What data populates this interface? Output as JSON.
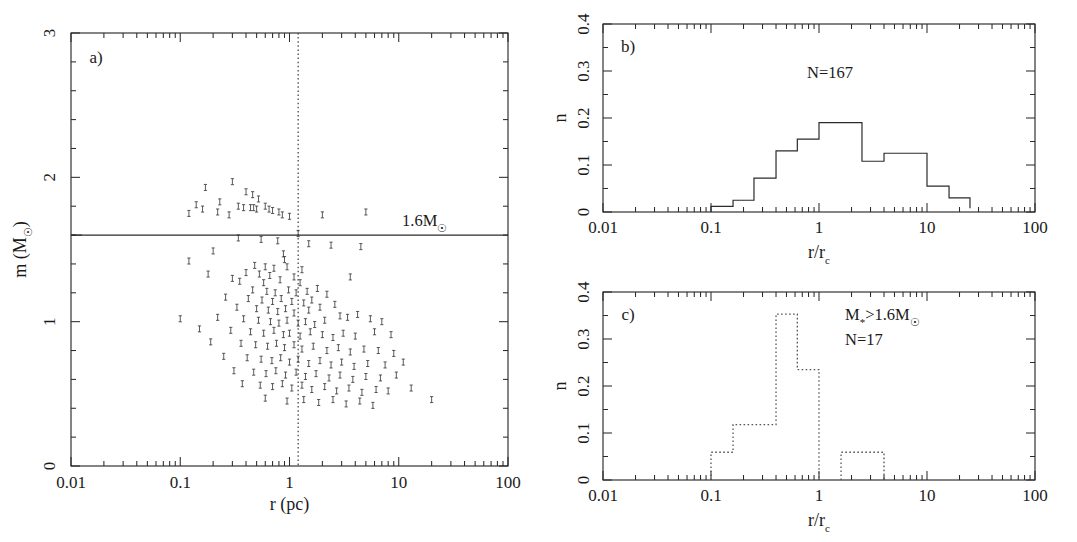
{
  "figure": {
    "background": "#ffffff",
    "ink": "#2b2b2b"
  },
  "panel_a": {
    "label": "a)",
    "xlabel": "r (pc)",
    "ylabel_main": "m (M",
    "ylabel_sub": "☉",
    "ylabel_close": ")",
    "xticklabels": [
      "0.01",
      "0.1",
      "1",
      "10",
      "100"
    ],
    "yticklabels": [
      "0",
      "1",
      "2",
      "3"
    ],
    "cut_label_main": "1.6M",
    "cut_label_sub": "☉",
    "cut_value": 1.6,
    "vline_value": 1.2
  },
  "panel_b": {
    "label": "b)",
    "xlabel_num": "r/r",
    "xlabel_sub": "c",
    "ylabel": "n",
    "annotation": "N=167",
    "xticklabels": [
      "0.01",
      "0.1",
      "1",
      "10",
      "100"
    ],
    "yticklabels": [
      "0",
      "0.1",
      "0.2",
      "0.3",
      "0.4"
    ]
  },
  "panel_c": {
    "label": "c)",
    "xlabel_num": "r/r",
    "xlabel_sub": "c",
    "ylabel": "n",
    "annotation_mass_pre": "M",
    "annotation_mass_star": "*",
    "annotation_mass_mid": ">1.6M",
    "annotation_mass_sun": "☉",
    "annotation_n": "N=17",
    "xticklabels": [
      "0.01",
      "0.1",
      "1",
      "10",
      "100"
    ],
    "yticklabels": [
      "0",
      "0.1",
      "0.2",
      "0.3",
      "0.4"
    ]
  },
  "chart_data": [
    {
      "type": "scatter",
      "panel": "a",
      "title": "",
      "xlabel": "r (pc)",
      "ylabel": "m (M☉)",
      "xscale": "log",
      "yscale": "linear",
      "xlim": [
        0.01,
        100
      ],
      "ylim": [
        0,
        3
      ],
      "xticks": [
        0.01,
        0.1,
        1,
        10,
        100
      ],
      "yticks": [
        0,
        1,
        2,
        3
      ],
      "grid": false,
      "annotations": [
        {
          "text": "a)",
          "x": 0.018,
          "y": 2.78
        },
        {
          "text": "1.6M☉",
          "x": 3.0,
          "y": 1.71
        }
      ],
      "reference_lines": [
        {
          "orientation": "horizontal",
          "value": 1.6,
          "style": "solid",
          "label": "1.6M☉"
        },
        {
          "orientation": "vertical",
          "value": 1.2,
          "style": "dotted",
          "label": ""
        }
      ],
      "marker": "small-errorbar-point",
      "points": [
        [
          0.17,
          1.93
        ],
        [
          0.3,
          1.97
        ],
        [
          0.4,
          1.9
        ],
        [
          0.46,
          1.88
        ],
        [
          0.52,
          1.85
        ],
        [
          0.23,
          1.83
        ],
        [
          0.34,
          1.8
        ],
        [
          0.6,
          1.8
        ],
        [
          0.65,
          1.78
        ],
        [
          0.8,
          1.76
        ],
        [
          0.14,
          1.81
        ],
        [
          0.16,
          1.78
        ],
        [
          0.22,
          1.76
        ],
        [
          0.38,
          1.79
        ],
        [
          0.44,
          1.79
        ],
        [
          0.47,
          1.79
        ],
        [
          0.5,
          1.78
        ],
        [
          0.7,
          1.77
        ],
        [
          0.86,
          1.74
        ],
        [
          1.0,
          1.73
        ],
        [
          0.12,
          1.75
        ],
        [
          0.28,
          1.74
        ],
        [
          2.0,
          1.74
        ],
        [
          5.0,
          1.76
        ],
        [
          1.2,
          1.61
        ],
        [
          0.34,
          1.58
        ],
        [
          0.55,
          1.57
        ],
        [
          0.78,
          1.56
        ],
        [
          1.5,
          1.54
        ],
        [
          2.4,
          1.53
        ],
        [
          4.5,
          1.52
        ],
        [
          0.2,
          1.49
        ],
        [
          0.88,
          1.47
        ],
        [
          0.9,
          1.43
        ],
        [
          0.12,
          1.42
        ],
        [
          0.48,
          1.39
        ],
        [
          0.6,
          1.38
        ],
        [
          0.72,
          1.37
        ],
        [
          0.95,
          1.38
        ],
        [
          1.3,
          1.36
        ],
        [
          0.18,
          1.33
        ],
        [
          0.4,
          1.34
        ],
        [
          0.53,
          1.33
        ],
        [
          0.66,
          1.32
        ],
        [
          1.1,
          1.31
        ],
        [
          0.3,
          1.3
        ],
        [
          0.35,
          1.28
        ],
        [
          0.58,
          1.27
        ],
        [
          0.82,
          1.29
        ],
        [
          1.25,
          1.27
        ],
        [
          3.6,
          1.31
        ],
        [
          0.46,
          1.22
        ],
        [
          0.62,
          1.21
        ],
        [
          0.74,
          1.2
        ],
        [
          0.98,
          1.22
        ],
        [
          1.15,
          1.2
        ],
        [
          1.45,
          1.21
        ],
        [
          1.8,
          1.23
        ],
        [
          2.2,
          1.19
        ],
        [
          0.26,
          1.17
        ],
        [
          0.42,
          1.16
        ],
        [
          0.56,
          1.15
        ],
        [
          0.7,
          1.14
        ],
        [
          0.84,
          1.16
        ],
        [
          1.05,
          1.14
        ],
        [
          1.35,
          1.13
        ],
        [
          1.6,
          1.15
        ],
        [
          0.33,
          1.1
        ],
        [
          0.5,
          1.09
        ],
        [
          0.64,
          1.08
        ],
        [
          0.78,
          1.07
        ],
        [
          0.92,
          1.09
        ],
        [
          1.1,
          1.06
        ],
        [
          1.5,
          1.08
        ],
        [
          1.9,
          1.1
        ],
        [
          2.6,
          1.12
        ],
        [
          0.1,
          1.02
        ],
        [
          0.22,
          1.03
        ],
        [
          0.38,
          1.02
        ],
        [
          0.52,
          1.01
        ],
        [
          0.67,
          1.0
        ],
        [
          0.8,
          0.99
        ],
        [
          0.95,
          1.01
        ],
        [
          1.2,
          0.99
        ],
        [
          1.4,
          1.0
        ],
        [
          1.7,
          0.98
        ],
        [
          2.1,
          1.01
        ],
        [
          2.9,
          1.04
        ],
        [
          3.4,
          1.03
        ],
        [
          4.2,
          1.05
        ],
        [
          5.5,
          1.02
        ],
        [
          7.0,
          1.0
        ],
        [
          0.15,
          0.95
        ],
        [
          0.29,
          0.94
        ],
        [
          0.44,
          0.93
        ],
        [
          0.58,
          0.92
        ],
        [
          0.72,
          0.94
        ],
        [
          0.88,
          0.91
        ],
        [
          1.0,
          0.92
        ],
        [
          1.25,
          0.9
        ],
        [
          1.55,
          0.93
        ],
        [
          2.0,
          0.91
        ],
        [
          2.5,
          0.89
        ],
        [
          3.1,
          0.92
        ],
        [
          4.0,
          0.9
        ],
        [
          6.0,
          0.93
        ],
        [
          8.5,
          0.91
        ],
        [
          0.19,
          0.86
        ],
        [
          0.36,
          0.85
        ],
        [
          0.49,
          0.84
        ],
        [
          0.63,
          0.83
        ],
        [
          0.76,
          0.85
        ],
        [
          0.9,
          0.82
        ],
        [
          1.1,
          0.84
        ],
        [
          1.3,
          0.81
        ],
        [
          1.65,
          0.83
        ],
        [
          2.2,
          0.8
        ],
        [
          2.8,
          0.82
        ],
        [
          3.6,
          0.79
        ],
        [
          4.8,
          0.81
        ],
        [
          6.5,
          0.8
        ],
        [
          9.0,
          0.78
        ],
        [
          0.25,
          0.76
        ],
        [
          0.41,
          0.75
        ],
        [
          0.55,
          0.74
        ],
        [
          0.69,
          0.73
        ],
        [
          0.83,
          0.75
        ],
        [
          1.0,
          0.72
        ],
        [
          1.2,
          0.74
        ],
        [
          1.5,
          0.71
        ],
        [
          1.9,
          0.73
        ],
        [
          2.4,
          0.7
        ],
        [
          3.0,
          0.72
        ],
        [
          3.9,
          0.69
        ],
        [
          5.2,
          0.71
        ],
        [
          7.5,
          0.7
        ],
        [
          11.0,
          0.72
        ],
        [
          0.31,
          0.66
        ],
        [
          0.47,
          0.65
        ],
        [
          0.61,
          0.64
        ],
        [
          0.75,
          0.66
        ],
        [
          0.92,
          0.63
        ],
        [
          1.15,
          0.65
        ],
        [
          1.4,
          0.62
        ],
        [
          1.75,
          0.64
        ],
        [
          2.3,
          0.61
        ],
        [
          2.9,
          0.63
        ],
        [
          3.8,
          0.6
        ],
        [
          5.0,
          0.62
        ],
        [
          6.8,
          0.61
        ],
        [
          9.5,
          0.63
        ],
        [
          0.37,
          0.57
        ],
        [
          0.54,
          0.56
        ],
        [
          0.7,
          0.55
        ],
        [
          0.86,
          0.57
        ],
        [
          1.05,
          0.54
        ],
        [
          1.3,
          0.56
        ],
        [
          1.6,
          0.53
        ],
        [
          2.1,
          0.55
        ],
        [
          2.7,
          0.52
        ],
        [
          3.5,
          0.54
        ],
        [
          4.6,
          0.51
        ],
        [
          6.2,
          0.53
        ],
        [
          8.0,
          0.52
        ],
        [
          13.0,
          0.54
        ],
        [
          0.6,
          0.47
        ],
        [
          0.95,
          0.45
        ],
        [
          1.35,
          0.46
        ],
        [
          1.85,
          0.44
        ],
        [
          2.5,
          0.46
        ],
        [
          3.3,
          0.43
        ],
        [
          4.4,
          0.45
        ],
        [
          5.8,
          0.42
        ],
        [
          20.0,
          0.46
        ]
      ]
    },
    {
      "type": "bar",
      "panel": "b",
      "subtype": "histogram-step",
      "title": "",
      "xlabel": "r/r_c",
      "ylabel": "n",
      "xscale": "log",
      "yscale": "linear",
      "xlim": [
        0.01,
        100
      ],
      "ylim": [
        0,
        0.4
      ],
      "xticks": [
        0.01,
        0.1,
        1,
        10,
        100
      ],
      "yticks": [
        0,
        0.1,
        0.2,
        0.3,
        0.4
      ],
      "grid": false,
      "line_style": "solid",
      "annotations": [
        {
          "text": "b)",
          "x": 0.018,
          "y": 0.365
        },
        {
          "text": "N=167",
          "x": 1.0,
          "y": 0.3
        }
      ],
      "bin_edges": [
        0.1,
        0.16,
        0.25,
        0.4,
        0.63,
        1.0,
        1.6,
        2.5,
        4.0,
        6.3,
        10.0,
        16.0,
        25.0
      ],
      "values": [
        0.012,
        0.025,
        0.072,
        0.13,
        0.155,
        0.19,
        0.19,
        0.108,
        0.125,
        0.125,
        0.055,
        0.03,
        0.008
      ],
      "total_count": 167
    },
    {
      "type": "bar",
      "panel": "c",
      "subtype": "histogram-step",
      "title": "",
      "xlabel": "r/r_c",
      "ylabel": "n",
      "xscale": "log",
      "yscale": "linear",
      "xlim": [
        0.01,
        100
      ],
      "ylim": [
        0,
        0.4
      ],
      "xticks": [
        0.01,
        0.1,
        1,
        10,
        100
      ],
      "yticks": [
        0,
        0.1,
        0.2,
        0.3,
        0.4
      ],
      "grid": false,
      "line_style": "dotted",
      "annotations": [
        {
          "text": "M*>1.6M☉",
          "x": 1.6,
          "y": 0.355
        },
        {
          "text": "N=17",
          "x": 1.6,
          "y": 0.305
        }
      ],
      "bin_edges": [
        0.1,
        0.16,
        0.4,
        0.63,
        1.0,
        1.6,
        4.0
      ],
      "values": [
        0.059,
        0.118,
        0.353,
        0.235,
        0.0,
        0.059
      ],
      "total_count": 17
    }
  ]
}
